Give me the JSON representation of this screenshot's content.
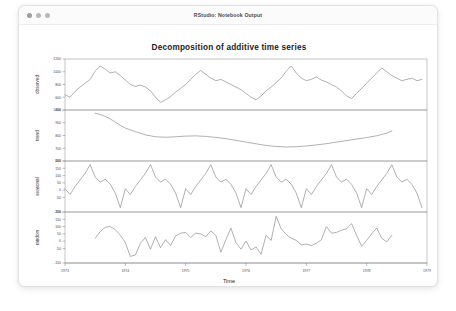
{
  "window": {
    "title": "RStudio: Notebook Output",
    "traffic_lights": [
      "close-button",
      "minimize-button",
      "zoom-button"
    ]
  },
  "chart_data": {
    "type": "line",
    "title": "Decomposition of additive time series",
    "xlabel": "Time",
    "ylabel": "",
    "grid": false,
    "legend_position": "none",
    "xlim": [
      1973.0,
      1979.0
    ],
    "x_ticks": [
      "1973",
      "1974",
      "1975",
      "1976",
      "1977",
      "1978",
      "1979"
    ],
    "x_tick_values": [
      1973,
      1974,
      1975,
      1976,
      1977,
      1978,
      1979
    ],
    "panels": [
      {
        "name": "observed",
        "label": "observed",
        "ylim": [
          400,
          1200
        ],
        "y_ticks": [
          "400",
          "600",
          "800",
          "1000",
          "1200"
        ],
        "y_tick_values": [
          400,
          600,
          800,
          1000,
          1200
        ],
        "x": [
          1973.0,
          1973.083,
          1973.167,
          1973.25,
          1973.333,
          1973.417,
          1973.5,
          1973.583,
          1973.667,
          1973.75,
          1973.833,
          1973.917,
          1974.0,
          1974.083,
          1974.167,
          1974.25,
          1974.333,
          1974.417,
          1974.5,
          1974.583,
          1974.667,
          1974.75,
          1974.833,
          1974.917,
          1975.0,
          1975.083,
          1975.167,
          1975.25,
          1975.333,
          1975.417,
          1975.5,
          1975.583,
          1975.667,
          1975.75,
          1975.833,
          1975.917,
          1976.0,
          1976.083,
          1976.167,
          1976.25,
          1976.333,
          1976.417,
          1976.5,
          1976.583,
          1976.667,
          1976.75,
          1976.833,
          1976.917,
          1977.0,
          1977.083,
          1977.167,
          1977.25,
          1977.333,
          1977.417,
          1977.5,
          1977.583,
          1977.667,
          1977.75,
          1977.833,
          1977.917,
          1978.0,
          1978.083,
          1978.167,
          1978.25,
          1978.333,
          1978.417,
          1978.5,
          1978.583,
          1978.667,
          1978.75,
          1978.833,
          1978.917
        ],
        "values": [
          640,
          600,
          690,
          760,
          820,
          880,
          1010,
          1090,
          1040,
          980,
          1000,
          940,
          870,
          800,
          770,
          790,
          760,
          700,
          600,
          520,
          560,
          610,
          680,
          740,
          800,
          880,
          960,
          1020,
          960,
          900,
          860,
          880,
          840,
          800,
          760,
          720,
          660,
          600,
          560,
          620,
          700,
          760,
          830,
          900,
          1010,
          1090,
          980,
          900,
          860,
          880,
          920,
          870,
          840,
          800,
          760,
          700,
          620,
          580,
          660,
          740,
          820,
          900,
          980,
          1060,
          1000,
          940,
          900,
          860,
          880,
          900,
          860,
          880
        ]
      },
      {
        "name": "trend",
        "label": "trend",
        "ylim": [
          600,
          1000
        ],
        "y_ticks": [
          "600",
          "700",
          "800",
          "900",
          "1000"
        ],
        "y_tick_values": [
          600,
          700,
          800,
          900,
          1000
        ],
        "x": [
          1973.5,
          1973.583,
          1973.667,
          1973.75,
          1973.833,
          1973.917,
          1974.0,
          1974.167,
          1974.333,
          1974.5,
          1974.667,
          1974.833,
          1975.0,
          1975.167,
          1975.333,
          1975.5,
          1975.667,
          1975.833,
          1976.0,
          1976.167,
          1976.333,
          1976.5,
          1976.667,
          1976.833,
          1977.0,
          1977.167,
          1977.333,
          1977.5,
          1977.667,
          1977.833,
          1978.0,
          1978.167,
          1978.333,
          1978.417
        ],
        "values": [
          975,
          965,
          950,
          930,
          905,
          880,
          858,
          830,
          805,
          790,
          786,
          790,
          795,
          797,
          793,
          785,
          775,
          762,
          748,
          735,
          722,
          714,
          710,
          712,
          718,
          726,
          736,
          748,
          760,
          772,
          784,
          798,
          818,
          835
        ]
      },
      {
        "name": "seasonal",
        "label": "seasonal",
        "ylim": [
          -150,
          200
        ],
        "y_ticks": [
          "-150",
          "-50",
          "0",
          "50",
          "100",
          "150",
          "200"
        ],
        "y_tick_values": [
          -150,
          -50,
          0,
          50,
          100,
          150,
          200
        ],
        "cycle_values": [
          10,
          -30,
          25,
          70,
          115,
          175,
          90,
          55,
          75,
          40,
          -20,
          -120
        ],
        "cycles": 6,
        "period_years": 1.0
      },
      {
        "name": "random",
        "label": "random",
        "ylim": [
          -150,
          200
        ],
        "y_ticks": [
          "-150",
          "-50",
          "0",
          "50",
          "100",
          "150",
          "200"
        ],
        "y_tick_values": [
          -150,
          -50,
          0,
          50,
          100,
          150,
          200
        ],
        "x": [
          1973.5,
          1973.583,
          1973.667,
          1973.75,
          1973.833,
          1973.917,
          1974.0,
          1974.083,
          1974.167,
          1974.25,
          1974.333,
          1974.417,
          1974.5,
          1974.583,
          1974.667,
          1974.75,
          1974.833,
          1974.917,
          1975.0,
          1975.083,
          1975.167,
          1975.25,
          1975.333,
          1975.417,
          1975.5,
          1975.583,
          1975.667,
          1975.75,
          1975.833,
          1975.917,
          1976.0,
          1976.083,
          1976.167,
          1976.25,
          1976.333,
          1976.417,
          1976.5,
          1976.583,
          1976.667,
          1976.75,
          1976.833,
          1976.917,
          1977.0,
          1977.083,
          1977.167,
          1977.25,
          1977.333,
          1977.417,
          1977.5,
          1977.583,
          1977.667,
          1977.75,
          1977.833,
          1977.917,
          1978.0,
          1978.083,
          1978.167,
          1978.25,
          1978.333,
          1978.417
        ],
        "values": [
          20,
          65,
          95,
          100,
          80,
          40,
          -10,
          -105,
          -95,
          -15,
          25,
          -55,
          30,
          -45,
          10,
          -30,
          35,
          55,
          60,
          25,
          55,
          50,
          30,
          70,
          40,
          -75,
          10,
          90,
          -10,
          -55,
          0,
          -60,
          -40,
          -90,
          40,
          5,
          170,
          85,
          45,
          20,
          5,
          -25,
          -20,
          -30,
          -15,
          10,
          100,
          55,
          60,
          75,
          85,
          120,
          40,
          -35,
          5,
          50,
          90,
          20,
          -5,
          40
        ]
      }
    ]
  }
}
